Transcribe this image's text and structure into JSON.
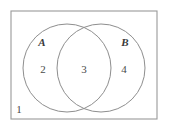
{
  "figure": {
    "type": "venn-diagram",
    "sets": 2,
    "background_color": "#ffffff",
    "line_color": "#8e8e8e",
    "text_color": "#4a4a4a"
  },
  "universe": {
    "label": "1",
    "border_color": "#9a9a9a",
    "x": 11,
    "y": 11,
    "width": 146,
    "height": 108,
    "label_x": 19,
    "label_y": 110
  },
  "sets": [
    {
      "name": "set-a",
      "label": "A",
      "label_x": 42,
      "label_y": 43,
      "cx": 67,
      "cy": 68,
      "r": 44
    },
    {
      "name": "set-b",
      "label": "B",
      "label_x": 125,
      "label_y": 43,
      "cx": 101,
      "cy": 68,
      "r": 44
    }
  ],
  "regions": [
    {
      "name": "region-a-only",
      "label": "2",
      "x": 43,
      "y": 70
    },
    {
      "name": "region-intersection",
      "label": "3",
      "x": 84,
      "y": 70
    },
    {
      "name": "region-b-only",
      "label": "4",
      "x": 124,
      "y": 70
    }
  ]
}
